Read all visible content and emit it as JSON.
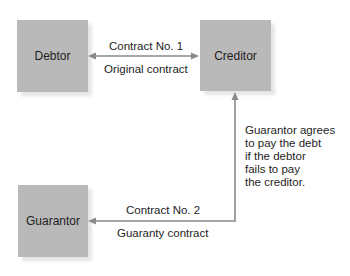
{
  "diagram": {
    "nodes": [
      {
        "id": "debtor",
        "label": "Debtor"
      },
      {
        "id": "creditor",
        "label": "Creditor"
      },
      {
        "id": "guarantor",
        "label": "Guarantor"
      }
    ],
    "edges": [
      {
        "from": "debtor",
        "to": "creditor",
        "bidirectional": true,
        "label_top": "Contract No. 1",
        "label_bottom": "Original contract"
      },
      {
        "from": "creditor",
        "to": "guarantor",
        "bidirectional": true,
        "label_top": "Contract No. 2",
        "label_bottom": "Guaranty contract"
      }
    ],
    "note": {
      "lines": [
        "Guarantor agrees",
        "to pay the debt",
        "if the debtor",
        "fails to pay",
        "the creditor."
      ]
    },
    "colors": {
      "box_fill": "#b9b9b9",
      "arrow": "#8a8a8a",
      "text": "#1e1e1e"
    }
  }
}
